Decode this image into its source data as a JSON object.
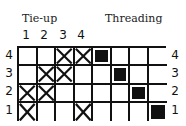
{
  "labels": {
    "tieup": "Tie-up",
    "threading": "Threading"
  },
  "tieup_columns": [
    "1",
    "2",
    "3",
    "4"
  ],
  "row_labels_left": [
    "4",
    "3",
    "2",
    "1"
  ],
  "row_labels_right": [
    "4",
    "3",
    "2",
    "1"
  ],
  "tieup": {
    "rows_top_to_bottom": [
      {
        "shaft": "4",
        "marked_columns": [
          3,
          4
        ]
      },
      {
        "shaft": "3",
        "marked_columns": [
          2,
          3
        ]
      },
      {
        "shaft": "2",
        "marked_columns": [
          1,
          2
        ]
      },
      {
        "shaft": "1",
        "marked_columns": [
          1,
          4
        ]
      }
    ],
    "mark_symbol": "cross"
  },
  "threading": {
    "columns": 4,
    "rows_top_to_bottom": [
      {
        "shaft": "4",
        "filled_column": 1
      },
      {
        "shaft": "3",
        "filled_column": 2
      },
      {
        "shaft": "2",
        "filled_column": 3
      },
      {
        "shaft": "1",
        "filled_column": 4
      }
    ],
    "mark_symbol": "filled-square"
  },
  "colors": {
    "ink": "#111111",
    "background": "#ffffff"
  }
}
